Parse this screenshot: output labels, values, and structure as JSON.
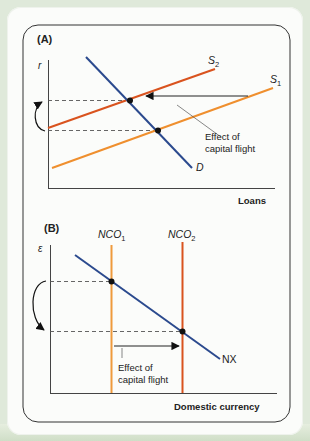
{
  "colors": {
    "background": "#dfe9da",
    "panel": "#fbfcfa",
    "border": "#333333",
    "demand": "#2b4a8e",
    "supply_new": "#d9531e",
    "supply_old": "#ef8f2e",
    "nco_old": "#ef9a3c",
    "nco_new": "#d9531e",
    "nx": "#2b4a8e",
    "dash": "#555555"
  },
  "panel_a": {
    "label": "(A)",
    "y_axis_label": "r",
    "x_axis_label": "Loans",
    "curves": {
      "demand": "D",
      "supply_new_prefix": "S",
      "supply_new_sub": "2",
      "supply_old_prefix": "S",
      "supply_old_sub": "1"
    },
    "annotation_line1": "Effect of",
    "annotation_line2": "capital flight"
  },
  "panel_b": {
    "label": "(B)",
    "y_axis_label": "ε",
    "x_axis_label": "Domestic currency",
    "curves": {
      "nco_old_prefix": "NCO",
      "nco_old_sub": "1",
      "nco_new_prefix": "NCO",
      "nco_new_sub": "2",
      "nx": "NX"
    },
    "annotation_line1": "Effect of",
    "annotation_line2": "capital flight"
  }
}
